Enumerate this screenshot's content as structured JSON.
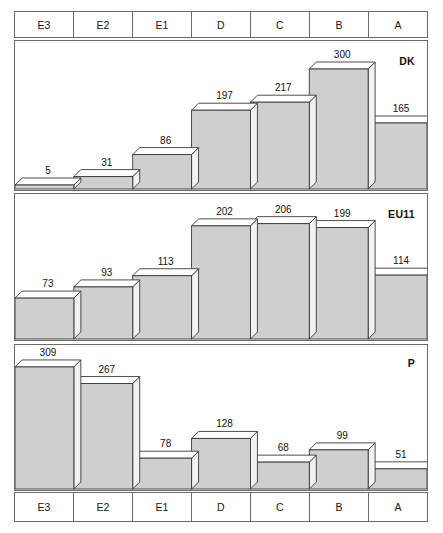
{
  "categories_top": [
    "E3",
    "E2",
    "E1",
    "D",
    "C",
    "B",
    "A"
  ],
  "categories_bottom": [
    "E3",
    "E2",
    "E1",
    "D",
    "C",
    "B",
    "A"
  ],
  "colors": {
    "bar_face": "#cfcfcf",
    "bar_top": "#ffffff",
    "bar_side": "#f2f2f2",
    "outline": "#3a3a3a",
    "frame": "#6b6b6b",
    "text": "#161616"
  },
  "panels": [
    {
      "label": "DK",
      "values": [
        5,
        31,
        86,
        197,
        217,
        300,
        165
      ]
    },
    {
      "label": "EU11",
      "values": [
        73,
        93,
        113,
        202,
        206,
        199,
        114
      ]
    },
    {
      "label": "P",
      "values": [
        309,
        267,
        78,
        128,
        68,
        99,
        51
      ]
    }
  ],
  "chart_data": {
    "type": "bar",
    "title": "",
    "subtitle": "",
    "xlabel": "",
    "ylabel": "",
    "grid": false,
    "legend_position": "none",
    "note": "Three stacked 3-D bar panels sharing one category axis (E3..A); each panel is labelled at its right with DK, EU11 and P respectively. Values are printed above every bar.",
    "categories": [
      "E3",
      "E2",
      "E1",
      "D",
      "C",
      "B",
      "A"
    ],
    "series": [
      {
        "name": "DK",
        "values": [
          5,
          31,
          86,
          197,
          217,
          300,
          165
        ]
      },
      {
        "name": "EU11",
        "values": [
          73,
          93,
          113,
          202,
          206,
          199,
          114
        ]
      },
      {
        "name": "P",
        "values": [
          309,
          267,
          78,
          128,
          68,
          99,
          51
        ]
      }
    ],
    "panels": [
      {
        "label": "DK",
        "categories": [
          "E3",
          "E2",
          "E1",
          "D",
          "C",
          "B",
          "A"
        ],
        "values": [
          5,
          31,
          86,
          197,
          217,
          300,
          165
        ],
        "ylim": [
          0,
          300
        ]
      },
      {
        "label": "EU11",
        "categories": [
          "E3",
          "E2",
          "E1",
          "D",
          "C",
          "B",
          "A"
        ],
        "values": [
          73,
          93,
          113,
          202,
          206,
          199,
          114
        ],
        "ylim": [
          0,
          206
        ]
      },
      {
        "label": "P",
        "categories": [
          "E3",
          "E2",
          "E1",
          "D",
          "C",
          "B",
          "A"
        ],
        "values": [
          309,
          267,
          78,
          128,
          68,
          99,
          51
        ],
        "ylim": [
          0,
          309
        ]
      }
    ]
  }
}
